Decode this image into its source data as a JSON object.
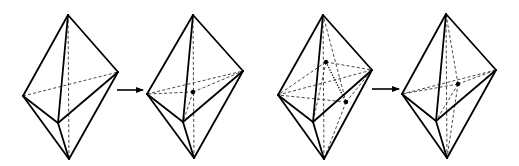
{
  "figure": {
    "width": 519,
    "height": 166,
    "colors": {
      "line": "#000000",
      "background": "#ffffff"
    },
    "shapes": [
      {
        "name": "octahedron-1",
        "vertices": {
          "top": [
            68,
            15
          ],
          "left": [
            23,
            96
          ],
          "right": [
            118,
            72
          ],
          "front": [
            58,
            123
          ],
          "bottom": [
            69,
            159
          ]
        },
        "solid_edges": [
          [
            "top",
            "left"
          ],
          [
            "top",
            "right"
          ],
          [
            "top",
            "front"
          ],
          [
            "left",
            "front"
          ],
          [
            "front",
            "right"
          ],
          [
            "left",
            "bottom"
          ],
          [
            "front",
            "bottom"
          ],
          [
            "right",
            "bottom"
          ]
        ],
        "dashed_edges": [
          [
            "left",
            "right"
          ],
          [
            "top",
            "bottom"
          ]
        ],
        "points": []
      },
      {
        "name": "octahedron-2",
        "vertices": {
          "top": [
            193,
            15
          ],
          "left": [
            147,
            94
          ],
          "right": [
            243,
            71
          ],
          "front": [
            183,
            122
          ],
          "bottom": [
            194,
            158
          ]
        },
        "solid_edges": [
          [
            "top",
            "left"
          ],
          [
            "top",
            "right"
          ],
          [
            "top",
            "front"
          ],
          [
            "left",
            "front"
          ],
          [
            "front",
            "right"
          ],
          [
            "left",
            "bottom"
          ],
          [
            "front",
            "bottom"
          ],
          [
            "right",
            "bottom"
          ]
        ],
        "dashed_edges": [
          [
            "left",
            "right"
          ],
          [
            "top",
            "bottom"
          ]
        ],
        "points": [
          [
            193,
            92
          ]
        ],
        "point_dashed_edges": [
          [
            [
              193,
              92
            ],
            [
              147,
              94
            ]
          ],
          [
            [
              193,
              92
            ],
            [
              243,
              71
            ]
          ],
          [
            [
              193,
              92
            ],
            [
              183,
              122
            ]
          ]
        ]
      },
      {
        "name": "octahedron-3",
        "vertices": {
          "top": [
            323,
            15
          ],
          "left": [
            278,
            95
          ],
          "right": [
            372,
            70
          ],
          "front": [
            313,
            122
          ],
          "bottom": [
            324,
            159
          ]
        },
        "solid_edges": [
          [
            "top",
            "left"
          ],
          [
            "top",
            "right"
          ],
          [
            "top",
            "front"
          ],
          [
            "left",
            "front"
          ],
          [
            "front",
            "right"
          ],
          [
            "left",
            "bottom"
          ],
          [
            "front",
            "bottom"
          ],
          [
            "right",
            "bottom"
          ]
        ],
        "dashed_edges": [
          [
            "left",
            "right"
          ],
          [
            "top",
            "bottom"
          ]
        ],
        "points": [
          [
            326,
            62
          ],
          [
            346,
            102
          ]
        ],
        "point_dashed_edges": [
          [
            [
              326,
              62
            ],
            [
              278,
              95
            ]
          ],
          [
            [
              326,
              62
            ],
            [
              372,
              70
            ]
          ],
          [
            [
              326,
              62
            ],
            [
              313,
              122
            ]
          ],
          [
            [
              346,
              102
            ],
            [
              278,
              95
            ]
          ],
          [
            [
              346,
              102
            ],
            [
              372,
              70
            ]
          ],
          [
            [
              346,
              102
            ],
            [
              324,
              159
            ]
          ],
          [
            [
              346,
              102
            ],
            [
              323,
              15
            ]
          ]
        ],
        "dotted_between_points": [
          [
            326,
            62
          ],
          [
            346,
            102
          ]
        ]
      },
      {
        "name": "octahedron-4",
        "vertices": {
          "top": [
            446,
            14
          ],
          "left": [
            402,
            94
          ],
          "right": [
            496,
            70
          ],
          "front": [
            436,
            121
          ],
          "bottom": [
            447,
            158
          ]
        },
        "solid_edges": [
          [
            "top",
            "left"
          ],
          [
            "top",
            "right"
          ],
          [
            "top",
            "front"
          ],
          [
            "left",
            "front"
          ],
          [
            "front",
            "right"
          ],
          [
            "left",
            "bottom"
          ],
          [
            "front",
            "bottom"
          ],
          [
            "right",
            "bottom"
          ]
        ],
        "dashed_edges": [
          [
            "left",
            "right"
          ],
          [
            "top",
            "bottom"
          ]
        ],
        "points": [
          [
            458,
            84
          ]
        ],
        "point_dashed_edges": [
          [
            [
              458,
              84
            ],
            [
              402,
              94
            ]
          ],
          [
            [
              458,
              84
            ],
            [
              496,
              70
            ]
          ],
          [
            [
              458,
              84
            ],
            [
              436,
              121
            ]
          ],
          [
            [
              458,
              84
            ],
            [
              446,
              14
            ]
          ],
          [
            [
              458,
              84
            ],
            [
              447,
              158
            ]
          ]
        ]
      }
    ],
    "arrows": [
      {
        "name": "arrow-1",
        "from": [
          117,
          90
        ],
        "to": [
          143,
          90
        ]
      },
      {
        "name": "arrow-2",
        "from": [
          372,
          89
        ],
        "to": [
          399,
          89
        ]
      }
    ]
  }
}
